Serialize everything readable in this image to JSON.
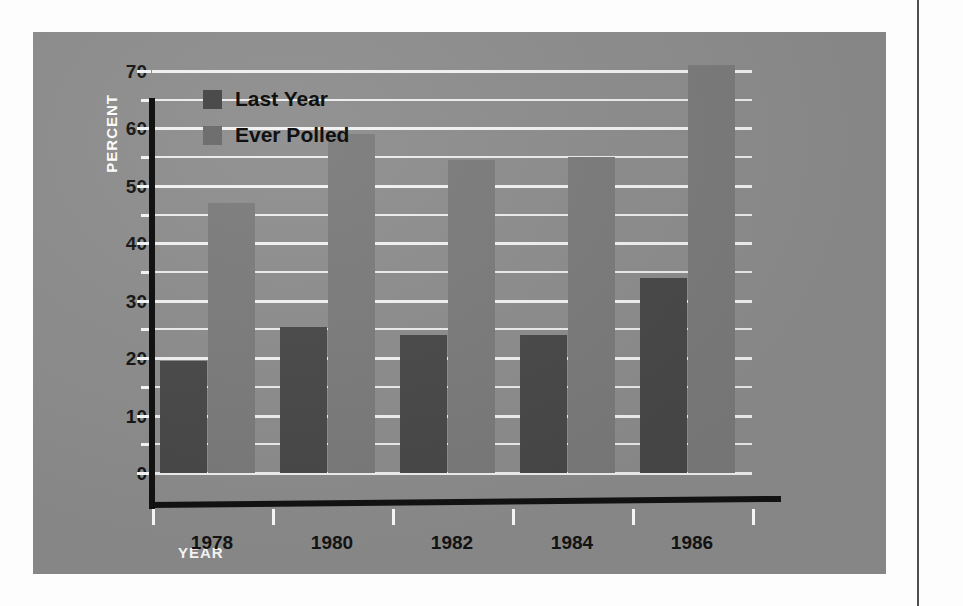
{
  "chart_data": {
    "type": "bar",
    "title": "",
    "xlabel": "YEAR",
    "ylabel": "PERCENT",
    "categories": [
      "1978",
      "1980",
      "1982",
      "1984",
      "1986"
    ],
    "series": [
      {
        "name": "Last Year",
        "values": [
          19.5,
          25.5,
          24,
          24,
          34
        ],
        "color": "#484848"
      },
      {
        "name": "Ever Polled",
        "values": [
          47,
          59,
          54.5,
          55,
          71
        ],
        "color": "#7b7b7b"
      }
    ],
    "ylim": [
      0,
      70
    ],
    "ytick_labels": [
      "0",
      "10",
      "20",
      "30",
      "40",
      "50",
      "60",
      "70"
    ],
    "ytick_values": [
      0,
      10,
      20,
      30,
      40,
      50,
      60,
      70
    ],
    "minor_gridlines": [
      5,
      15,
      25,
      35,
      45,
      55,
      65
    ],
    "grid": true,
    "legend_position": "top-left",
    "panel_background": "#8d8d8d",
    "gridline_color": "#f2f2f2",
    "axis_color": "#121212"
  },
  "axes": {
    "y_title": "PERCENT",
    "x_title": "YEAR"
  },
  "legend": {
    "entries": [
      {
        "label": "Last Year",
        "swatch": "dark-gray-swatch"
      },
      {
        "label": "Ever Polled",
        "swatch": "medium-gray-swatch"
      }
    ]
  }
}
